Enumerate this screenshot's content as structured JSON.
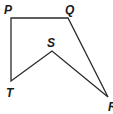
{
  "diagram": {
    "type": "polygon",
    "stroke_color": "#2a2a2a",
    "vertices": [
      {
        "name": "P",
        "label": "P",
        "x": 11,
        "y": 18,
        "lx": 4,
        "ly": 14
      },
      {
        "name": "Q",
        "label": "Q",
        "x": 68,
        "y": 18,
        "lx": 65,
        "ly": 14
      },
      {
        "name": "R",
        "label": "R",
        "x": 108,
        "y": 97,
        "lx": 108,
        "ly": 111
      },
      {
        "name": "S",
        "label": "S",
        "x": 52,
        "y": 51,
        "lx": 47,
        "ly": 47
      },
      {
        "name": "T",
        "label": "T",
        "x": 11,
        "y": 81,
        "lx": 6,
        "ly": 97
      }
    ],
    "edges": [
      [
        "P",
        "Q"
      ],
      [
        "Q",
        "R"
      ],
      [
        "R",
        "S"
      ],
      [
        "S",
        "T"
      ],
      [
        "T",
        "P"
      ]
    ]
  }
}
